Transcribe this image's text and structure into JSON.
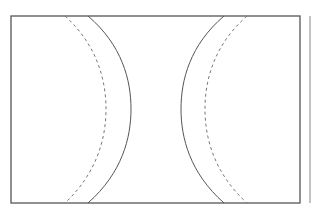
{
  "diagram": {
    "frame": {
      "x": 11,
      "y": 16,
      "width": 289,
      "height": 187,
      "stroke": "#555555"
    },
    "right_edge_line": {
      "x": 310,
      "y1": 16,
      "y2": 203,
      "stroke": "#9a9a9a"
    },
    "arcs": [
      {
        "id": "left-solid",
        "style": "solid",
        "top_x": 88,
        "bottom_x": 88,
        "apex_x": 131,
        "stroke": "#555555"
      },
      {
        "id": "left-dashed",
        "style": "dashed",
        "top_x": 65,
        "bottom_x": 65,
        "apex_x": 106,
        "stroke": "#777777"
      },
      {
        "id": "right-solid",
        "style": "solid",
        "top_x": 224,
        "bottom_x": 224,
        "apex_x": 181,
        "stroke": "#555555"
      },
      {
        "id": "right-dashed",
        "style": "dashed",
        "top_x": 247,
        "bottom_x": 247,
        "apex_x": 205,
        "stroke": "#777777"
      }
    ]
  }
}
